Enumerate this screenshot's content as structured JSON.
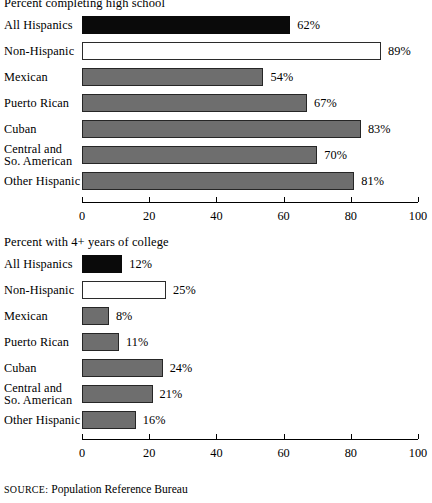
{
  "source_note": {
    "prefix": "SOURCE:",
    "text": "Population Reference Bureau"
  },
  "axis": {
    "ticks": [
      "0",
      "20",
      "40",
      "60",
      "80",
      "100"
    ],
    "min": 0,
    "max": 100
  },
  "chart_data": [
    {
      "type": "bar",
      "orientation": "horizontal",
      "title": "Percent completing high school",
      "xlabel": "",
      "ylabel": "",
      "xlim": [
        0,
        100
      ],
      "grid": false,
      "legend": "none",
      "categories": [
        "All Hispanics",
        "Non-Hispanic",
        "Mexican",
        "Puerto Rican",
        "Cuban",
        "Central and So. American",
        "Other Hispanic"
      ],
      "category_lines": [
        [
          "All Hispanics"
        ],
        [
          "Non-Hispanic"
        ],
        [
          "Mexican"
        ],
        [
          "Puerto Rican"
        ],
        [
          "Cuban"
        ],
        [
          "Central and",
          "So. American"
        ],
        [
          "Other Hispanic"
        ]
      ],
      "values": [
        62,
        89,
        54,
        67,
        83,
        70,
        81
      ],
      "value_labels": [
        "62%",
        "89%",
        "54%",
        "67%",
        "83%",
        "70%",
        "81%"
      ],
      "bar_styles": [
        "black",
        "white",
        "gray",
        "gray",
        "gray",
        "gray",
        "gray"
      ]
    },
    {
      "type": "bar",
      "orientation": "horizontal",
      "title": "Percent with 4+ years of college",
      "xlabel": "",
      "ylabel": "",
      "xlim": [
        0,
        100
      ],
      "grid": false,
      "legend": "none",
      "categories": [
        "All Hispanics",
        "Non-Hispanic",
        "Mexican",
        "Puerto Rican",
        "Cuban",
        "Central and So. American",
        "Other Hispanic"
      ],
      "category_lines": [
        [
          "All Hispanics"
        ],
        [
          "Non-Hispanic"
        ],
        [
          "Mexican"
        ],
        [
          "Puerto Rican"
        ],
        [
          "Cuban"
        ],
        [
          "Central and",
          "So. American"
        ],
        [
          "Other Hispanic"
        ]
      ],
      "values": [
        12,
        25,
        8,
        11,
        24,
        21,
        16
      ],
      "value_labels": [
        "12%",
        "25%",
        "8%",
        "11%",
        "24%",
        "21%",
        "16%"
      ],
      "bar_styles": [
        "black",
        "white",
        "gray",
        "gray",
        "gray",
        "gray",
        "gray"
      ]
    }
  ]
}
